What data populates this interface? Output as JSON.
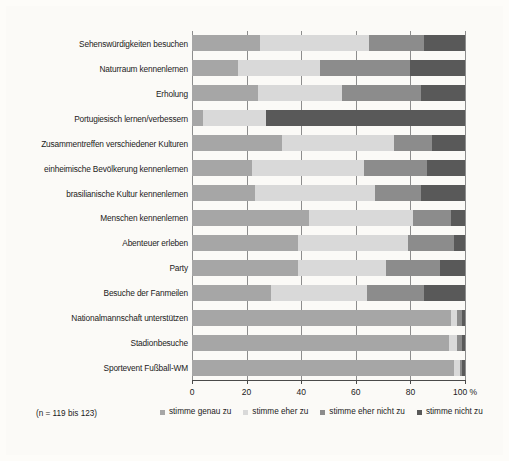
{
  "note": "(n = 119 bis 123)",
  "axis": {
    "ticks": [
      "0",
      "20",
      "40",
      "60",
      "80",
      "100 %"
    ],
    "values": [
      0,
      20,
      40,
      60,
      80,
      100
    ]
  },
  "legend": {
    "items": [
      {
        "label": "stimme genau zu",
        "color": "#a6a6a6"
      },
      {
        "label": "stimme eher zu",
        "color": "#d9d9d9"
      },
      {
        "label": "stimme eher nicht zu",
        "color": "#8c8c8c"
      },
      {
        "label": "stimme nicht zu",
        "color": "#595959"
      }
    ]
  },
  "chart_data": {
    "type": "bar",
    "orientation": "horizontal",
    "stacked": true,
    "stack_total": 100,
    "title": "",
    "xlabel": "100 %",
    "ylabel": "",
    "xlim": [
      0,
      100
    ],
    "grid": true,
    "legend_position": "bottom",
    "annotation": "(n = 119 bis 123)",
    "categories": [
      "Sehenswürdigkeiten besuchen",
      "Naturraum kennenlernen",
      "Erholung",
      "Portugiesisch lernen/verbessern",
      "Zusammentreffen verschiedener Kulturen",
      "einheimische Bevölkerung kennenlernen",
      "brasilianische Kultur kennenlernen",
      "Menschen kennenlernen",
      "Abenteuer erleben",
      "Party",
      "Besuche der Fanmeilen",
      "Nationalmannschaft unterstützen",
      "Stadionbesuche",
      "Sportevent Fußball-WM"
    ],
    "series": [
      {
        "name": "stimme genau zu",
        "color": "#a6a6a6",
        "values": [
          25,
          17,
          24,
          4,
          33,
          22,
          23,
          43,
          39,
          39,
          29,
          95,
          94,
          96
        ]
      },
      {
        "name": "stimme eher zu",
        "color": "#d9d9d9",
        "values": [
          40,
          30,
          31,
          23,
          41,
          41,
          44,
          38,
          40,
          32,
          35,
          2,
          3,
          2
        ]
      },
      {
        "name": "stimme eher nicht zu",
        "color": "#8c8c8c",
        "values": [
          20,
          33,
          29,
          0,
          14,
          23,
          17,
          14,
          17,
          20,
          21,
          2,
          2,
          1
        ]
      },
      {
        "name": "stimme nicht zu",
        "color": "#595959",
        "values": [
          15,
          20,
          16,
          73,
          12,
          14,
          16,
          5,
          4,
          9,
          15,
          1,
          1,
          1
        ]
      }
    ]
  }
}
